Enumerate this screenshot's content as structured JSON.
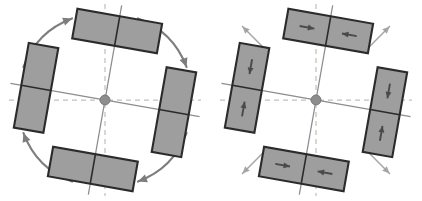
{
  "figure": {
    "width": 422,
    "height": 201,
    "background": "#ffffff",
    "panel_count": 2
  },
  "colors": {
    "block_fill": "#9e9e9e",
    "block_outline": "#2b2b2b",
    "axis_solid": "#8d8d8d",
    "axis_dashed": "#c9bfb8",
    "hub": "#8d8d8d",
    "rotation_arrow": "#7d7d7d",
    "radial_arrow": "#a5a5a5",
    "internal_arrow": "#4a4a4a"
  },
  "geometry": {
    "center_x": 105,
    "center_y": 100,
    "rotation_deg": 10,
    "hub_radius": 5,
    "block_long": 86,
    "block_short": 30,
    "block_offset": 70
  },
  "panels": [
    {
      "id": "panel-left",
      "name": "rotation-panel",
      "label": "",
      "arrow_style": "curved-thick",
      "rotation_sense": "clockwise",
      "shows_internal_arrows": false,
      "blocks": [
        {
          "name": "block-top",
          "position": "top",
          "orientation": "horizontal",
          "cells": 2,
          "cell_arrows": [
            "",
            ""
          ]
        },
        {
          "name": "block-right",
          "position": "right",
          "orientation": "vertical",
          "cells": 2,
          "cell_arrows": [
            "",
            ""
          ]
        },
        {
          "name": "block-bottom",
          "position": "bottom",
          "orientation": "horizontal",
          "cells": 2,
          "cell_arrows": [
            "",
            ""
          ]
        },
        {
          "name": "block-left",
          "position": "left",
          "orientation": "vertical",
          "cells": 2,
          "cell_arrows": [
            "",
            ""
          ]
        }
      ],
      "corner_arrows": [
        {
          "name": "rotation-arrow-top-left",
          "corner": "top-left",
          "direction": "up-right"
        },
        {
          "name": "rotation-arrow-top-right",
          "corner": "top-right",
          "direction": "down-right"
        },
        {
          "name": "rotation-arrow-bottom-right",
          "corner": "bottom-right",
          "direction": "down-left"
        },
        {
          "name": "rotation-arrow-bottom-left",
          "corner": "bottom-left",
          "direction": "up-left"
        }
      ]
    },
    {
      "id": "panel-right",
      "name": "convergence-panel",
      "label": "",
      "arrow_style": "straight-thin",
      "rotation_sense": "clockwise",
      "shows_internal_arrows": true,
      "blocks": [
        {
          "name": "block-top",
          "position": "top",
          "orientation": "horizontal",
          "cells": 2,
          "cell_arrows": [
            "right",
            "left"
          ]
        },
        {
          "name": "block-right",
          "position": "right",
          "orientation": "vertical",
          "cells": 2,
          "cell_arrows": [
            "down",
            "up"
          ]
        },
        {
          "name": "block-bottom",
          "position": "bottom",
          "orientation": "horizontal",
          "cells": 2,
          "cell_arrows": [
            "right",
            "left"
          ]
        },
        {
          "name": "block-left",
          "position": "left",
          "orientation": "vertical",
          "cells": 2,
          "cell_arrows": [
            "down",
            "up"
          ]
        }
      ],
      "corner_arrows": [
        {
          "name": "radial-arrow-top-left",
          "corner": "top-left",
          "direction": "up-right"
        },
        {
          "name": "radial-arrow-top-right",
          "corner": "top-right",
          "direction": "down-right"
        },
        {
          "name": "radial-arrow-bottom-right",
          "corner": "bottom-right",
          "direction": "down-left"
        },
        {
          "name": "radial-arrow-bottom-left",
          "corner": "bottom-left",
          "direction": "up-left"
        }
      ]
    }
  ]
}
